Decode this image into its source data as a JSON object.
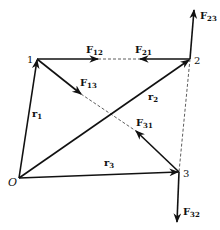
{
  "diagram": {
    "points": {
      "origin": {
        "label": "O"
      },
      "p1": {
        "label": "1"
      },
      "p2": {
        "label": "2"
      },
      "p3": {
        "label": "3"
      }
    },
    "position_vectors": [
      {
        "name": "r",
        "sub": "1"
      },
      {
        "name": "r",
        "sub": "2"
      },
      {
        "name": "r",
        "sub": "3"
      }
    ],
    "forces": [
      {
        "name": "F",
        "sub": "12"
      },
      {
        "name": "F",
        "sub": "21"
      },
      {
        "name": "F",
        "sub": "13"
      },
      {
        "name": "F",
        "sub": "31"
      },
      {
        "name": "F",
        "sub": "23"
      },
      {
        "name": "F",
        "sub": "32"
      }
    ],
    "colors": {
      "ink": "#111111",
      "background": "#ffffff"
    }
  }
}
